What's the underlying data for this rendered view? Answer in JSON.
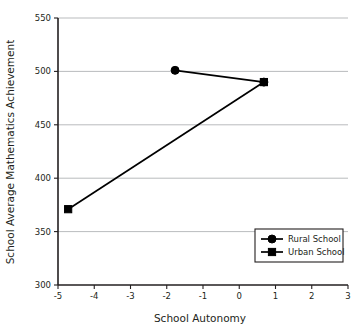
{
  "chart_data": {
    "type": "line",
    "title": "",
    "xlabel": "School Autonomy",
    "ylabel": "School Average Mathematics Achievement",
    "xlim": [
      -5,
      3
    ],
    "ylim": [
      300,
      550
    ],
    "xticks": [
      -5,
      -4,
      -3,
      -2,
      -1,
      0,
      1,
      2,
      3
    ],
    "xticklabels": [
      "-5",
      "-4",
      "-3",
      "-2",
      "-1",
      "0",
      "1",
      "2",
      "3"
    ],
    "yticks": [
      300,
      350,
      400,
      450,
      500,
      550
    ],
    "yticklabels": [
      "300",
      "350",
      "400",
      "450",
      "500",
      "550"
    ],
    "grid": "horizontal",
    "legend_position": "lower right",
    "series": [
      {
        "name": "Rural School",
        "marker": "circle",
        "color": "#000000",
        "points": [
          {
            "x": -1.77,
            "y": 501
          },
          {
            "x": 0.68,
            "y": 490
          }
        ]
      },
      {
        "name": "Urban School",
        "marker": "square",
        "color": "#000000",
        "points": [
          {
            "x": -4.72,
            "y": 371
          },
          {
            "x": 0.68,
            "y": 490
          }
        ]
      }
    ]
  },
  "legend": {
    "entries": [
      {
        "label": "Rural School",
        "marker": "circle"
      },
      {
        "label": "Urban School",
        "marker": "square"
      }
    ]
  },
  "axis": {
    "x_title": "School Autonomy",
    "y_title": "School Average Mathematics Achievement"
  }
}
